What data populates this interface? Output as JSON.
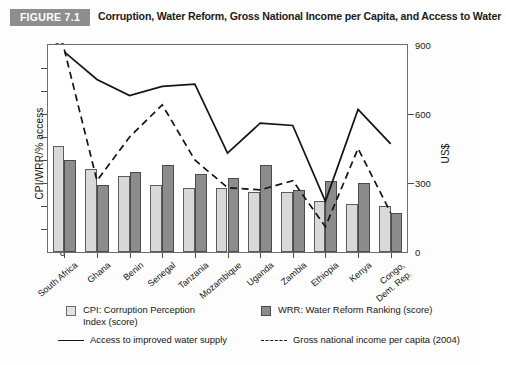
{
  "header": {
    "figure_label": "FIGURE 7.1",
    "title": "Corruption, Water Reform, Gross National Income per Capita, and Access to Water"
  },
  "axes": {
    "y_left_label": "CPI/WRR/% access",
    "y_right_label": "US$",
    "y_left_ticks": [
      "0",
      "10",
      "20",
      "30",
      "40",
      "50",
      "60",
      "70",
      "80",
      "90"
    ],
    "y_right_ticks": [
      "0",
      "300",
      "600",
      "900"
    ],
    "y_left_range": [
      0,
      90
    ],
    "y_right_range": [
      0,
      900
    ]
  },
  "legend": {
    "cpi": "CPI: Corruption Perception\nIndex (score)",
    "cpi_line1": "CPI: Corruption Perception",
    "cpi_line2": "Index (score)",
    "wrr": "WRR: Water Reform Ranking (score)",
    "access": "Access to improved water supply",
    "gni": "Gross national income per capita (2004)"
  },
  "chart_data": {
    "type": "bar",
    "title": "Corruption, Water Reform, Gross National Income per Capita, and Access to Water",
    "xlabel": "",
    "ylabel": "CPI/WRR/% access",
    "y2label": "US$",
    "ylim": [
      0,
      90
    ],
    "y2lim": [
      0,
      900
    ],
    "grid": false,
    "legend_position": "bottom",
    "categories": [
      "South Africa",
      "Ghana",
      "Benin",
      "Senegal",
      "Tanzania",
      "Mozambique",
      "Uganda",
      "Zambia",
      "Ethiopia",
      "Kenya",
      "Congo, Dem. Rep."
    ],
    "series": [
      {
        "name": "CPI: Corruption Perception Index (score)",
        "type": "bar",
        "axis": "left",
        "values": [
          46,
          36,
          33,
          29,
          28,
          28,
          26,
          26,
          22,
          21,
          20
        ]
      },
      {
        "name": "WRR: Water Reform Ranking (score)",
        "type": "bar",
        "axis": "left",
        "values": [
          40,
          29,
          35,
          38,
          34,
          32,
          38,
          27,
          31,
          30,
          17
        ]
      },
      {
        "name": "Access to improved water supply",
        "type": "line",
        "axis": "left",
        "style": "solid",
        "values": [
          87,
          75,
          68,
          72,
          73,
          43,
          56,
          55,
          22,
          62,
          47
        ]
      },
      {
        "name": "Gross national income per capita (2004)",
        "type": "line",
        "axis": "right",
        "style": "dashed",
        "values": [
          880,
          310,
          500,
          640,
          400,
          280,
          270,
          310,
          110,
          450,
          170
        ]
      }
    ]
  }
}
